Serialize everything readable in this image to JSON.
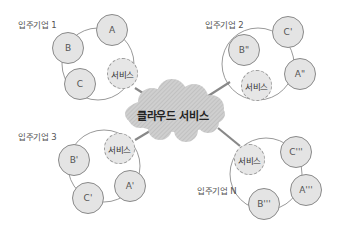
{
  "diagram": {
    "cloud": {
      "label": "클라우드 서비스"
    },
    "tenants": [
      {
        "label": "입주기업 1",
        "service": "서비스",
        "nodes": [
          "A",
          "B",
          "C"
        ]
      },
      {
        "label": "입주기업 2",
        "service": "서비스",
        "nodes": [
          "B\"",
          "C'",
          "A\""
        ]
      },
      {
        "label": "입주기업 3",
        "service": "서비스",
        "nodes": [
          "B'",
          "C'",
          "A'"
        ]
      },
      {
        "label": "입주기업 N",
        "service": "서비스",
        "nodes": [
          "C'''",
          "A'''",
          "B'''"
        ]
      }
    ]
  }
}
